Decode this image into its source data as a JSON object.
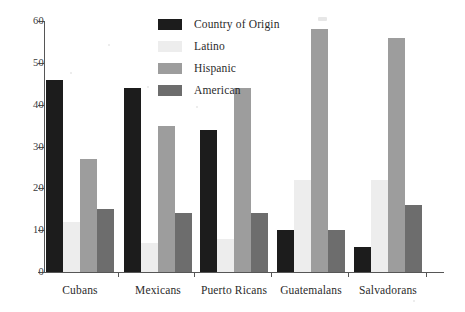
{
  "chart_data": {
    "type": "bar",
    "title": "",
    "xlabel": "",
    "ylabel": "",
    "ylim": [
      0,
      60
    ],
    "yticks": [
      0,
      10,
      20,
      30,
      40,
      50,
      60
    ],
    "grid": false,
    "legend_position": "top-right",
    "categories": [
      "Cubans",
      "Mexicans",
      "Puerto Ricans",
      "Guatemalans",
      "Salvadorans"
    ],
    "series": [
      {
        "name": "Country of Origin",
        "color": "#1c1c1c",
        "values": [
          46,
          44,
          34,
          10,
          6
        ]
      },
      {
        "name": "Latino",
        "color": "#ededed",
        "values": [
          12,
          7,
          8,
          22,
          22
        ]
      },
      {
        "name": "Hispanic",
        "color": "#9d9d9d",
        "values": [
          27,
          35,
          44,
          58,
          56
        ]
      },
      {
        "name": "American",
        "color": "#6d6d6d",
        "values": [
          15,
          14,
          14,
          10,
          16
        ]
      }
    ]
  },
  "axis": {
    "tick_labels": [
      "60",
      "50",
      "40",
      "30",
      "20",
      "10",
      "0"
    ]
  },
  "legend": {
    "items": [
      {
        "label": "Country of Origin"
      },
      {
        "label": "Latino"
      },
      {
        "label": "Hispanic"
      },
      {
        "label": "American"
      }
    ]
  }
}
